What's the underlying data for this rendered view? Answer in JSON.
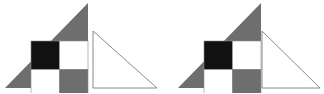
{
  "canvas": {
    "width": 324,
    "height": 93,
    "background": "#ffffff",
    "description": "Two geometric figures side by side: a gray right triangle with a 2x2 checkerboard overlay next to a plain white outlined right triangle, and the same checkered triangle joined with the white triangle."
  },
  "colors": {
    "gray_fill": "#6e6e6e",
    "black_fill": "#111111",
    "white_fill": "#ffffff",
    "outline": "#8a8a8a",
    "background": "#ffffff"
  },
  "figures": [
    {
      "id": "left-figure",
      "label": "separated-pair",
      "parts": [
        {
          "id": "left-gray-triangle",
          "label": "gray-checkered-right-triangle",
          "fill": "#6e6e6e",
          "points": "5,88 88,88 88,3"
        },
        {
          "id": "left-checker",
          "label": "checkerboard-2x2",
          "x": 31,
          "y": 41,
          "cell": 28.5,
          "cells": [
            {
              "row": 0,
              "col": 0,
              "fill": "#111111",
              "name": "black-cell"
            },
            {
              "row": 0,
              "col": 1,
              "fill": "#ffffff",
              "name": "white-cell"
            },
            {
              "row": 1,
              "col": 0,
              "fill": "#ffffff",
              "name": "white-cell"
            },
            {
              "row": 1,
              "col": 1,
              "fill": "#6e6e6e",
              "name": "gray-cell"
            }
          ]
        },
        {
          "id": "left-white-triangle",
          "label": "white-outline-right-triangle",
          "fill": "#ffffff",
          "stroke": "#8a8a8a",
          "points": "93,31 93,88 157,88"
        }
      ]
    },
    {
      "id": "right-figure",
      "label": "joined-pair",
      "parts": [
        {
          "id": "right-gray-triangle",
          "label": "gray-checkered-right-triangle",
          "fill": "#6e6e6e",
          "points": "178,88 261,88 261,3"
        },
        {
          "id": "right-checker",
          "label": "checkerboard-2x2",
          "x": 204,
          "y": 41,
          "cell": 28.5,
          "cells": [
            {
              "row": 0,
              "col": 0,
              "fill": "#111111",
              "name": "black-cell"
            },
            {
              "row": 0,
              "col": 1,
              "fill": "#ffffff",
              "name": "white-cell"
            },
            {
              "row": 1,
              "col": 0,
              "fill": "#ffffff",
              "name": "white-cell"
            },
            {
              "row": 1,
              "col": 1,
              "fill": "#6e6e6e",
              "name": "gray-cell"
            }
          ]
        },
        {
          "id": "right-white-triangle",
          "label": "white-outline-right-triangle",
          "fill": "#ffffff",
          "stroke": "#8a8a8a",
          "points": "262,31 262,88 320,88"
        }
      ]
    }
  ]
}
